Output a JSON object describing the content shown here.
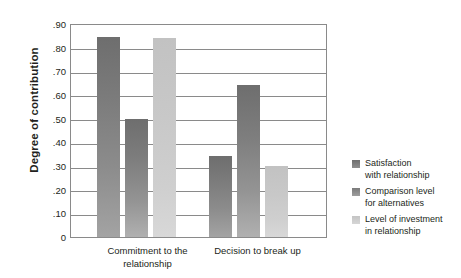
{
  "chart_data": {
    "type": "bar",
    "title": "",
    "xlabel": "",
    "ylabel": "Degree of contribution",
    "ylim": [
      0,
      0.9
    ],
    "grid": true,
    "legend_position": "right",
    "categories": [
      "Commitment to\nthe relationship",
      "Decision to\nbreak up"
    ],
    "ytick_labels": [
      ".90",
      ".80",
      ".70",
      ".60",
      ".50",
      ".40",
      ".30",
      ".20",
      ".10",
      "0"
    ],
    "ytick_values": [
      0.9,
      0.8,
      0.7,
      0.6,
      0.5,
      0.4,
      0.3,
      0.2,
      0.1,
      0
    ],
    "series": [
      {
        "name": "Satisfaction\nwith relationship",
        "color": "#7f7f7f",
        "values": [
          0.85,
          0.345
        ]
      },
      {
        "name": "Comparison level\nfor alternatives",
        "color": "#8c8c8c",
        "values": [
          0.5,
          0.645
        ]
      },
      {
        "name": "Level of investment\nin relationship",
        "color": "#cccccc",
        "values": [
          0.845,
          0.3
        ]
      }
    ]
  }
}
